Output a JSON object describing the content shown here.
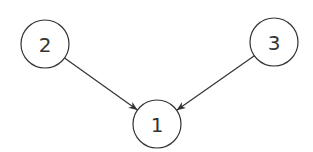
{
  "diagram": {
    "type": "directed-graph",
    "nodes": [
      {
        "id": "1",
        "label": "1",
        "cx": 157,
        "cy": 124,
        "r": 24
      },
      {
        "id": "2",
        "label": "2",
        "cx": 45,
        "cy": 44,
        "r": 24
      },
      {
        "id": "3",
        "label": "3",
        "cx": 274,
        "cy": 42,
        "r": 24
      }
    ],
    "edges": [
      {
        "from": "2",
        "to": "1"
      },
      {
        "from": "3",
        "to": "1"
      }
    ],
    "colors": {
      "stroke": "#333333",
      "background": "#ffffff"
    }
  }
}
